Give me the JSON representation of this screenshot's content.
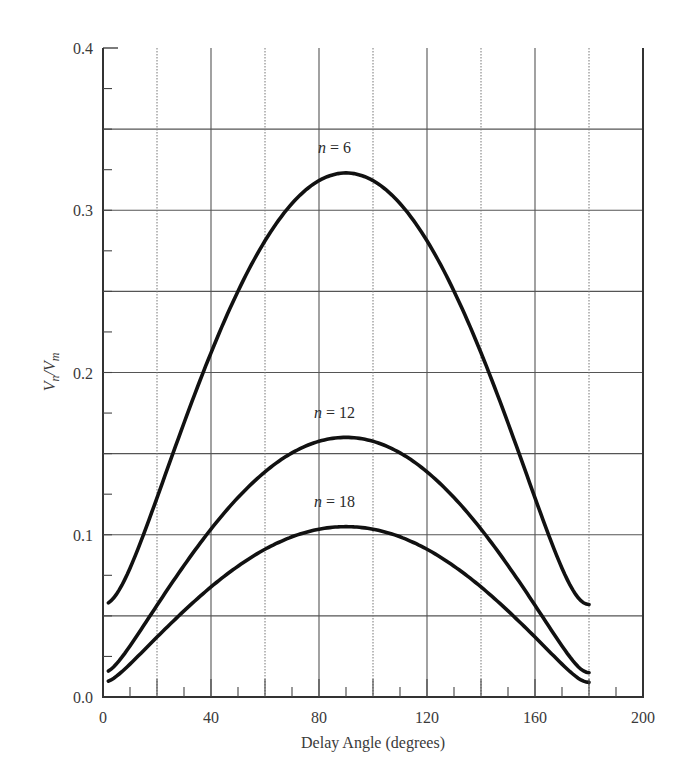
{
  "chart_data": {
    "type": "line",
    "title": "",
    "xlabel": "Delay Angle (degrees)",
    "ylabel": "Vn/Vm",
    "xlim": [
      0,
      200
    ],
    "ylim": [
      0.0,
      0.4
    ],
    "x_ticks": [
      0,
      40,
      80,
      120,
      160,
      200
    ],
    "x_tick_labels": [
      "0",
      "40",
      "80",
      "120",
      "160",
      "200"
    ],
    "y_ticks": [
      0.0,
      0.1,
      0.2,
      0.3,
      0.4
    ],
    "y_tick_labels": [
      "0.0",
      "0.1",
      "0.2",
      "0.3",
      "0.4"
    ],
    "grid": {
      "vertical_solid": [
        40,
        80,
        120,
        160
      ],
      "vertical_dotted": [
        20,
        60,
        100,
        140,
        180
      ],
      "horizontal_solid": [
        0.05,
        0.1,
        0.15,
        0.2,
        0.25,
        0.3,
        0.35
      ],
      "x_minor_every": 10,
      "y_minor_every": 0.025
    },
    "legend": "none (inline curve labels)",
    "x": [
      0,
      10,
      20,
      30,
      40,
      50,
      60,
      70,
      80,
      90,
      100,
      110,
      120,
      130,
      140,
      150,
      160,
      170,
      180
    ],
    "series": [
      {
        "name": "n = 6",
        "label_pos": [
          85,
          0.335
        ],
        "values": [
          0.057,
          0.066,
          0.089,
          0.12,
          0.155,
          0.19,
          0.224,
          0.255,
          0.28,
          0.323,
          0.28,
          0.255,
          0.224,
          0.19,
          0.155,
          0.12,
          0.089,
          0.066,
          0.057
        ]
      },
      {
        "name": "n = 12",
        "label_pos": [
          85,
          0.172
        ],
        "values": [
          0.015,
          0.02,
          0.034,
          0.053,
          0.075,
          0.098,
          0.119,
          0.137,
          0.152,
          0.16,
          0.152,
          0.137,
          0.119,
          0.098,
          0.075,
          0.053,
          0.034,
          0.02,
          0.015
        ]
      },
      {
        "name": "n = 18",
        "label_pos": [
          85,
          0.117
        ],
        "values": [
          0.009,
          0.013,
          0.022,
          0.035,
          0.049,
          0.064,
          0.078,
          0.09,
          0.1,
          0.105,
          0.1,
          0.09,
          0.078,
          0.064,
          0.049,
          0.035,
          0.022,
          0.013,
          0.009
        ]
      }
    ],
    "x_range_of_curves": [
      2,
      180
    ]
  },
  "labels": {
    "ylabel_main": "V",
    "ylabel_sub_n": "n",
    "ylabel_slash": "/V",
    "ylabel_sub_m": "m",
    "xlabel": "Delay Angle (degrees)",
    "curve_n6": "n = 6",
    "curve_n12": "n = 12",
    "curve_n18": "n = 18"
  }
}
